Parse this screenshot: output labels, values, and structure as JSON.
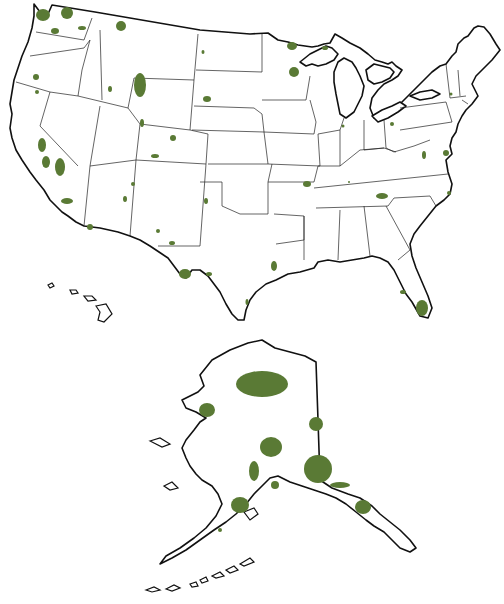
{
  "map": {
    "subject": "United States protected lands (national parks) map",
    "background_color": "#ffffff",
    "outline_color": "#111111",
    "park_color": "#5a7a35",
    "regions": [
      "contiguous-us",
      "hawaii",
      "alaska"
    ],
    "parks_contiguous": [
      {
        "name": "olympic",
        "cx": 43,
        "cy": 15,
        "rx": 7,
        "ry": 6
      },
      {
        "name": "north-cascades",
        "cx": 67,
        "cy": 13,
        "rx": 6,
        "ry": 6
      },
      {
        "name": "mount-rainier",
        "cx": 55,
        "cy": 31,
        "rx": 4,
        "ry": 3
      },
      {
        "name": "lake-chelan",
        "cx": 82,
        "cy": 28,
        "rx": 4,
        "ry": 2
      },
      {
        "name": "glacier",
        "cx": 121,
        "cy": 26,
        "rx": 5,
        "ry": 5
      },
      {
        "name": "crater-lake",
        "cx": 36,
        "cy": 77,
        "rx": 3,
        "ry": 3
      },
      {
        "name": "craters-of-moon",
        "cx": 110,
        "cy": 89,
        "rx": 2,
        "ry": 3
      },
      {
        "name": "yellowstone",
        "cx": 140,
        "cy": 85,
        "rx": 6,
        "ry": 12
      },
      {
        "name": "grand-teton",
        "cx": 142,
        "cy": 123,
        "rx": 2,
        "ry": 4
      },
      {
        "name": "wind-cave",
        "cx": 207,
        "cy": 99,
        "rx": 4,
        "ry": 3
      },
      {
        "name": "theodore-roosevelt",
        "cx": 203,
        "cy": 52,
        "rx": 1.5,
        "ry": 2
      },
      {
        "name": "rocky-mountain",
        "cx": 173,
        "cy": 138,
        "rx": 3,
        "ry": 3
      },
      {
        "name": "dinosaur",
        "cx": 155,
        "cy": 156,
        "rx": 4,
        "ry": 2
      },
      {
        "name": "lassen",
        "cx": 37,
        "cy": 92,
        "rx": 2,
        "ry": 2
      },
      {
        "name": "yosemite",
        "cx": 42,
        "cy": 145,
        "rx": 4,
        "ry": 7
      },
      {
        "name": "kings-canyon-sequoia",
        "cx": 60,
        "cy": 167,
        "rx": 5,
        "ry": 9
      },
      {
        "name": "death-valley",
        "cx": 46,
        "cy": 162,
        "rx": 4,
        "ry": 6
      },
      {
        "name": "joshua-tree",
        "cx": 67,
        "cy": 201,
        "rx": 6,
        "ry": 3
      },
      {
        "name": "saguaro",
        "cx": 90,
        "cy": 227,
        "rx": 3,
        "ry": 3
      },
      {
        "name": "petrified-forest",
        "cx": 125,
        "cy": 199,
        "rx": 2,
        "ry": 3
      },
      {
        "name": "mesa-verde",
        "cx": 133,
        "cy": 184,
        "rx": 2,
        "ry": 2
      },
      {
        "name": "carlsbad",
        "cx": 158,
        "cy": 231,
        "rx": 2,
        "ry": 2
      },
      {
        "name": "guadalupe",
        "cx": 172,
        "cy": 243,
        "rx": 3,
        "ry": 2
      },
      {
        "name": "big-bend",
        "cx": 185,
        "cy": 274,
        "rx": 6,
        "ry": 5
      },
      {
        "name": "amistad",
        "cx": 209,
        "cy": 274,
        "rx": 3,
        "ry": 2
      },
      {
        "name": "wichita",
        "cx": 206,
        "cy": 201,
        "rx": 2,
        "ry": 3
      },
      {
        "name": "hot-springs",
        "cx": 307,
        "cy": 184,
        "rx": 4,
        "ry": 3
      },
      {
        "name": "mammoth-cave",
        "cx": 349,
        "cy": 182,
        "rx": 1,
        "ry": 1
      },
      {
        "name": "great-smoky",
        "cx": 382,
        "cy": 196,
        "rx": 6,
        "ry": 3
      },
      {
        "name": "shenandoah",
        "cx": 424,
        "cy": 155,
        "rx": 2,
        "ry": 4
      },
      {
        "name": "assateague",
        "cx": 446,
        "cy": 153,
        "rx": 3,
        "ry": 3
      },
      {
        "name": "cape-hatteras",
        "cx": 449,
        "cy": 193,
        "rx": 2,
        "ry": 2
      },
      {
        "name": "voyageurs",
        "cx": 292,
        "cy": 46,
        "rx": 5,
        "ry": 4
      },
      {
        "name": "apostle-islands",
        "cx": 294,
        "cy": 72,
        "rx": 5,
        "ry": 5
      },
      {
        "name": "isle-royale",
        "cx": 325,
        "cy": 48,
        "rx": 3,
        "ry": 2
      },
      {
        "name": "indiana-dunes",
        "cx": 343,
        "cy": 126,
        "rx": 1.5,
        "ry": 1.5
      },
      {
        "name": "cuyahoga",
        "cx": 392,
        "cy": 124,
        "rx": 2,
        "ry": 2
      },
      {
        "name": "catskill",
        "cx": 451,
        "cy": 94,
        "rx": 1.5,
        "ry": 1.5
      },
      {
        "name": "padre-island",
        "cx": 247,
        "cy": 302,
        "rx": 1.5,
        "ry": 3
      },
      {
        "name": "big-thicket",
        "cx": 274,
        "cy": 266,
        "rx": 3,
        "ry": 5
      },
      {
        "name": "big-cypress",
        "cx": 403,
        "cy": 292,
        "rx": 3,
        "ry": 2
      },
      {
        "name": "everglades",
        "cx": 422,
        "cy": 308,
        "rx": 6,
        "ry": 8
      }
    ],
    "parks_alaska": [
      {
        "name": "gates-of-the-arctic",
        "cx": 262,
        "cy": 384,
        "rx": 26,
        "ry": 13
      },
      {
        "name": "bering-land-bridge",
        "cx": 207,
        "cy": 410,
        "rx": 8,
        "ry": 7
      },
      {
        "name": "yukon-charley",
        "cx": 316,
        "cy": 424,
        "rx": 7,
        "ry": 7
      },
      {
        "name": "denali",
        "cx": 271,
        "cy": 447,
        "rx": 11,
        "ry": 10
      },
      {
        "name": "wrangell-st-elias",
        "cx": 318,
        "cy": 469,
        "rx": 14,
        "ry": 14
      },
      {
        "name": "lake-clark",
        "cx": 254,
        "cy": 471,
        "rx": 5,
        "ry": 10
      },
      {
        "name": "katmai",
        "cx": 240,
        "cy": 505,
        "rx": 9,
        "ry": 8
      },
      {
        "name": "kenai-fjords",
        "cx": 275,
        "cy": 485,
        "rx": 4,
        "ry": 4
      },
      {
        "name": "glacier-bay",
        "cx": 363,
        "cy": 507,
        "rx": 8,
        "ry": 7
      },
      {
        "name": "aniakchak",
        "cx": 220,
        "cy": 530,
        "rx": 2,
        "ry": 2
      },
      {
        "name": "tongass-strip",
        "cx": 340,
        "cy": 485,
        "rx": 10,
        "ry": 3
      }
    ]
  }
}
